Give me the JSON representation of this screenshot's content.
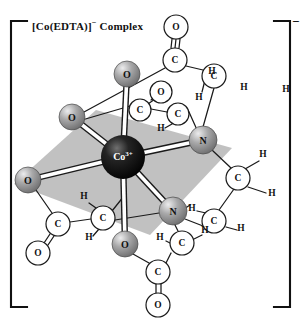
{
  "figure": {
    "title_prefix": "[Co(EDTA)]",
    "title_charge": "−",
    "title_suffix": " Complex",
    "overall_charge": "−",
    "bracket_left": "[",
    "bracket_right": "]"
  },
  "chart_data": {
    "type": "diagram",
    "title": "[Co(EDTA)]− Complex",
    "subtitle": "",
    "legend": [],
    "colors": {
      "metal_center": "#0d0d0d",
      "donor_sphere": "#9a9a9a",
      "donor_sphere_highlight": "#e8e8e8",
      "light_atom_fill": "#ffffff",
      "plane_fill": "#b9b9b9",
      "bond_stroke": "#1a1a1a",
      "background": "#ffffff",
      "bracket": "#111111"
    },
    "atoms": [
      {
        "id": "Co",
        "label": "Co",
        "charge": "3+",
        "element": "Co",
        "style": "metal",
        "x": 123,
        "y": 157,
        "r": 22
      },
      {
        "id": "O_ax_top",
        "label": "O",
        "element": "O",
        "style": "donor",
        "x": 127,
        "y": 74,
        "r": 13
      },
      {
        "id": "O_ax_bottom",
        "label": "O",
        "element": "O",
        "style": "donor",
        "x": 125,
        "y": 244,
        "r": 13
      },
      {
        "id": "O_eq_upleft",
        "label": "O",
        "element": "O",
        "style": "donor",
        "x": 72,
        "y": 117,
        "r": 13
      },
      {
        "id": "O_eq_left",
        "label": "O",
        "element": "O",
        "style": "donor",
        "x": 28,
        "y": 180,
        "r": 13
      },
      {
        "id": "N_eq_right",
        "label": "N",
        "element": "N",
        "style": "donor",
        "x": 203,
        "y": 140,
        "r": 14
      },
      {
        "id": "N_eq_lower",
        "label": "N",
        "element": "N",
        "style": "donor",
        "x": 173,
        "y": 211,
        "r": 14
      },
      {
        "id": "C_top_carboxyl",
        "label": "C",
        "element": "C",
        "style": "light",
        "x": 175,
        "y": 60,
        "r": 12
      },
      {
        "id": "O_top_double",
        "label": "O",
        "element": "O",
        "style": "light",
        "x": 176,
        "y": 27,
        "r": 12
      },
      {
        "id": "C_top_methylene",
        "label": "C",
        "element": "C",
        "style": "light",
        "x": 214,
        "y": 76,
        "r": 12
      },
      {
        "id": "O_rear",
        "label": "O",
        "element": "O",
        "style": "light",
        "x": 161,
        "y": 92,
        "r": 11
      },
      {
        "id": "C_rear_carboxyl",
        "label": "C",
        "element": "C",
        "style": "light",
        "x": 140,
        "y": 110,
        "r": 11
      },
      {
        "id": "C_rear_methylene",
        "label": "C",
        "element": "C",
        "style": "light",
        "x": 178,
        "y": 114,
        "r": 11
      },
      {
        "id": "C_eth_upper",
        "label": "C",
        "element": "C",
        "style": "light",
        "x": 238,
        "y": 178,
        "r": 12
      },
      {
        "id": "C_eth_lower",
        "label": "C",
        "element": "C",
        "style": "light",
        "x": 214,
        "y": 221,
        "r": 12
      },
      {
        "id": "C_left_carboxyl",
        "label": "C",
        "element": "C",
        "style": "light",
        "x": 58,
        "y": 224,
        "r": 12
      },
      {
        "id": "O_left_double",
        "label": "O",
        "element": "O",
        "style": "light",
        "x": 38,
        "y": 253,
        "r": 12
      },
      {
        "id": "C_left_methylene",
        "label": "C",
        "element": "C",
        "style": "light",
        "x": 103,
        "y": 218,
        "r": 12
      },
      {
        "id": "C_bot_carboxyl",
        "label": "C",
        "element": "C",
        "style": "light",
        "x": 158,
        "y": 272,
        "r": 12
      },
      {
        "id": "O_bot_double",
        "label": "O",
        "element": "O",
        "style": "light",
        "x": 158,
        "y": 305,
        "r": 12
      },
      {
        "id": "C_bot_methylene",
        "label": "C",
        "element": "C",
        "style": "light",
        "x": 182,
        "y": 243,
        "r": 12
      }
    ],
    "hydrogens": [
      {
        "label": "H",
        "x": 244,
        "y": 90
      },
      {
        "label": "H",
        "x": 286,
        "y": 92
      },
      {
        "label": "H",
        "x": 199,
        "y": 100
      },
      {
        "label": "H",
        "x": 212,
        "y": 74
      },
      {
        "label": "H",
        "x": 161,
        "y": 131
      },
      {
        "label": "H",
        "x": 263,
        "y": 157
      },
      {
        "label": "H",
        "x": 272,
        "y": 196
      },
      {
        "label": "H",
        "x": 192,
        "y": 211
      },
      {
        "label": "H",
        "x": 241,
        "y": 231
      },
      {
        "label": "H",
        "x": 84,
        "y": 199
      },
      {
        "label": "H",
        "x": 89,
        "y": 240
      },
      {
        "label": "H",
        "x": 160,
        "y": 240
      },
      {
        "label": "H",
        "x": 205,
        "y": 233
      }
    ],
    "bonds_metal": [
      {
        "from": "Co",
        "to": "O_ax_top",
        "kind": "axial"
      },
      {
        "from": "Co",
        "to": "O_ax_bottom",
        "kind": "axial"
      },
      {
        "from": "Co",
        "to": "O_eq_upleft",
        "kind": "equatorial"
      },
      {
        "from": "Co",
        "to": "O_eq_left",
        "kind": "equatorial"
      },
      {
        "from": "Co",
        "to": "N_eq_right",
        "kind": "equatorial"
      },
      {
        "from": "Co",
        "to": "N_eq_lower",
        "kind": "equatorial"
      }
    ],
    "plane": {
      "label": "equatorial coordination plane",
      "points": "14,184 96,110 232,148 150,235"
    },
    "bond_count_total": 38,
    "geometry": "octahedral",
    "donor_set": "N2O4 hexadentate"
  }
}
